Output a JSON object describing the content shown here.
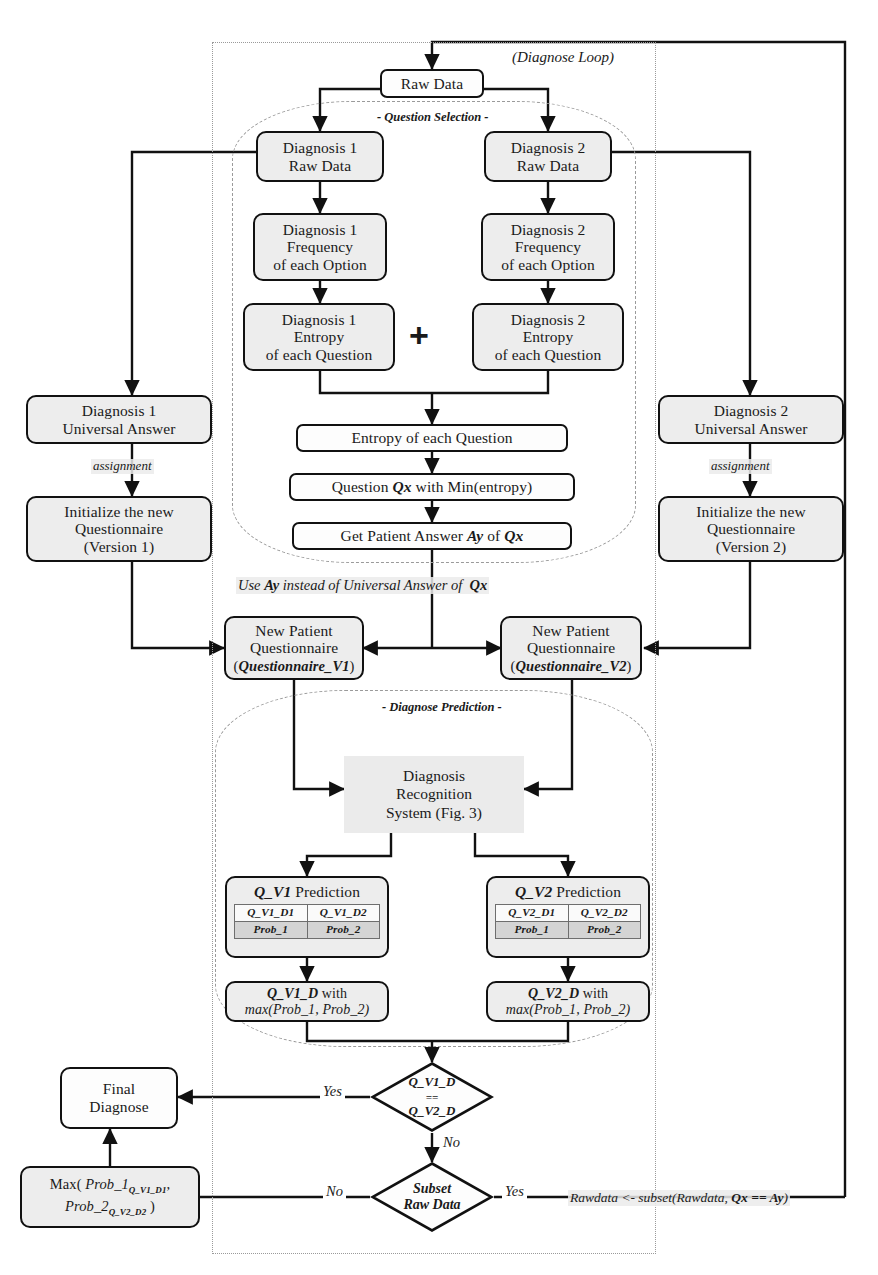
{
  "figure": {
    "type": "flowchart",
    "title_annotations": {
      "diagnose_loop": "(Diagnose Loop)",
      "question_selection": "- Question Selection -",
      "diagnose_prediction": "- Diagnose Prediction -"
    }
  },
  "nodes": {
    "raw_data": "Raw Data",
    "d1_raw": "Diagnosis 1\nRaw Data",
    "d2_raw": "Diagnosis 2\nRaw Data",
    "d1_freq_l1": "Diagnosis 1",
    "d1_freq_l2": "Frequency",
    "d1_freq_l3": "of each Option",
    "d2_freq_l1": "Diagnosis 2",
    "d2_freq_l2": "Frequency",
    "d2_freq_l3": "of each Option",
    "d1_ent_l1": "Diagnosis 1",
    "d1_ent_l2": "Entropy",
    "d1_ent_l3": "of each Question",
    "d2_ent_l1": "Diagnosis 2",
    "d2_ent_l2": "Entropy",
    "d2_ent_l3": "of each Question",
    "entropy_each": "Entropy of each Question",
    "question_min": "Question Qx with Min(entropy)",
    "get_answer": "Get Patient Answer Ay of Qx",
    "d1_universal_l1": "Diagnosis 1",
    "d1_universal_l2": "Universal Answer",
    "d2_universal_l1": "Diagnosis 2",
    "d2_universal_l2": "Universal Answer",
    "init_v1_l1": "Initialize the new",
    "init_v1_l2": "Questionnaire",
    "init_v1_l3": "(Version 1)",
    "init_v2_l1": "Initialize the new",
    "init_v2_l2": "Questionnaire",
    "init_v2_l3": "(Version 2)",
    "npq_v1_l1": "New Patient",
    "npq_v1_l2": "Questionnaire",
    "npq_v1_l3": "(Questionnaire_V1)",
    "npq_v2_l1": "New Patient",
    "npq_v2_l2": "Questionnaire",
    "npq_v2_l3": "(Questionnaire_V2)",
    "drs_l1": "Diagnosis",
    "drs_l2": "Recognition",
    "drs_l3": "System (Fig. 3)",
    "final_diagnose_l1": "Final",
    "final_diagnose_l2": "Diagnose"
  },
  "predictions": [
    {
      "title_bold": "Q_V1",
      "title_rest": " Prediction",
      "cols": [
        "Q_V1_D1",
        "Q_V1_D2"
      ],
      "probs": [
        "Prob_1",
        "Prob_2"
      ],
      "result_l1_bold": "Q_V1_D",
      "result_l1_rest": " with",
      "result_l2": "max(Prob_1, Prob_2)"
    },
    {
      "title_bold": "Q_V2",
      "title_rest": " Prediction",
      "cols": [
        "Q_V2_D1",
        "Q_V2_D2"
      ],
      "probs": [
        "Prob_1",
        "Prob_2"
      ],
      "result_l1_bold": "Q_V2_D",
      "result_l1_rest": " with",
      "result_l2": "max(Prob_1, Prob_2)"
    }
  ],
  "max_box": {
    "prefix": "Max( ",
    "term1": "Prob_1",
    "term1_sub": "Q_V1_D1",
    "term1_tail": ",",
    "term2": "Prob_2",
    "term2_sub": "Q_V2_D2",
    "suffix": " )"
  },
  "decisions": [
    {
      "name": "equality",
      "l1": "Q_V1_D",
      "l2": "==",
      "l3": "Q_V2_D",
      "yes_label": "Yes",
      "no_label": "No"
    },
    {
      "name": "subset",
      "l1": "Subset",
      "l2": "Raw Data",
      "yes_label": "Yes",
      "no_label": "No"
    }
  ],
  "annotations": {
    "assignment_left": "assignment",
    "assignment_right": "assignment",
    "use_ay": "Use Ay instead of Universal Answer of  Qx",
    "use_ay_plain": "Use ",
    "use_ay_b1": "Ay",
    "use_ay_mid": " instead of Universal Answer of  ",
    "use_ay_b2": "Qx",
    "subset_expr_pre": "Rawdata <- subset(Rawdata, ",
    "subset_expr_bold": "Qx == Ay",
    "subset_expr_post": ")",
    "plus_sign": "+"
  },
  "colors": {
    "node_fill": "#ededed",
    "node_fill_white": "#fdfdfd",
    "node_stroke": "#111111",
    "frame_stroke": "#9a9a9a",
    "table_row_alt": "#d4d4d4",
    "wire": "#111111"
  }
}
